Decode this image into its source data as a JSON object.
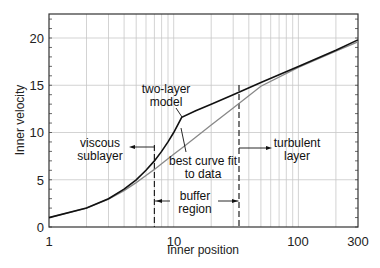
{
  "chart_data": {
    "type": "line",
    "title": "",
    "xlabel": "Inner position",
    "ylabel": "Inner velocity",
    "xscale": "log",
    "xlim": [
      1,
      300
    ],
    "ylim": [
      0,
      22.5
    ],
    "grid": true,
    "x_ticks": [
      1,
      10,
      100,
      300
    ],
    "x_tick_labels": [
      "1",
      "10",
      "100",
      "300"
    ],
    "y_ticks": [
      0,
      5,
      10,
      15,
      20
    ],
    "y_tick_labels": [
      "0",
      "5",
      "10",
      "15",
      "20"
    ],
    "series": [
      {
        "name": "two-layer model",
        "color": "#111111",
        "x": [
          1,
          2,
          3,
          4,
          5,
          6,
          7,
          8,
          9,
          10,
          11.6,
          15,
          20,
          30,
          50,
          100,
          200,
          300
        ],
        "y": [
          1,
          2,
          3,
          4,
          5,
          6,
          7,
          8,
          9,
          10,
          11.6,
          12.3,
          13.0,
          14.0,
          15.3,
          17.0,
          18.7,
          19.8
        ]
      },
      {
        "name": "best curve fit to data",
        "color": "#888888",
        "x": [
          1,
          2,
          3,
          4,
          5,
          6,
          7,
          8,
          10,
          12,
          15,
          20,
          30,
          50,
          100,
          200,
          300
        ],
        "y": [
          1,
          2,
          2.95,
          3.85,
          4.7,
          5.45,
          6.1,
          6.7,
          7.7,
          8.5,
          9.5,
          10.8,
          12.6,
          14.9,
          16.9,
          18.6,
          19.6
        ]
      }
    ],
    "vertical_dashed_lines": [
      7,
      33
    ],
    "annotations": [
      {
        "text": "two-layer model",
        "lines": [
          "two-layer",
          "model"
        ],
        "target": "kink at x=11.6"
      },
      {
        "text": "viscous sublayer",
        "lines": [
          "viscous",
          "sublayer"
        ],
        "arrow": "left from x=7"
      },
      {
        "text": "best curve fit to data",
        "lines": [
          "best curve fit",
          "to data"
        ],
        "target": "gray curve"
      },
      {
        "text": "buffer region",
        "lines": [
          "buffer",
          "region"
        ],
        "arrow": "between x=7 and x=33"
      },
      {
        "text": "turbulent layer",
        "lines": [
          "turbulent",
          "layer"
        ],
        "arrow": "right from x=33"
      }
    ]
  },
  "labels": {
    "xlabel": "Inner position",
    "ylabel": "Inner velocity",
    "two_layer_1": "two-layer",
    "two_layer_2": "model",
    "viscous_1": "viscous",
    "viscous_2": "sublayer",
    "bestfit_1": "best curve fit",
    "bestfit_2": "to data",
    "buffer_1": "buffer",
    "buffer_2": "region",
    "turbulent_1": "turbulent",
    "turbulent_2": "layer",
    "xt_1": "1",
    "xt_10": "10",
    "xt_100": "100",
    "xt_300": "300",
    "yt_0": "0",
    "yt_5": "5",
    "yt_10": "10",
    "yt_15": "15",
    "yt_20": "20"
  }
}
